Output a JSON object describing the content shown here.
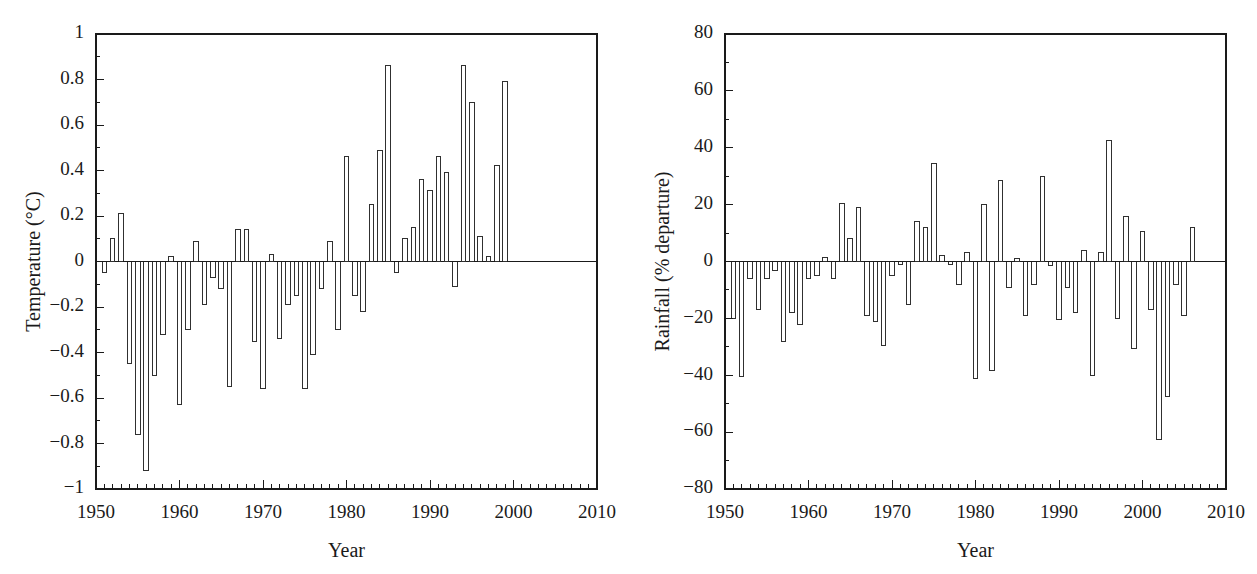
{
  "figure": {
    "background": "#ffffff",
    "ink_color": "#1a1a1a",
    "panel_count": 2
  },
  "chart_data": [
    {
      "id": "temperature-panel",
      "type": "bar",
      "title": "",
      "xlabel": "Year",
      "ylabel": "Temperature (°C)",
      "xlim": [
        1950,
        2010
      ],
      "ylim": [
        -1,
        1
      ],
      "grid": false,
      "legend": null,
      "xticks": [
        1950,
        1960,
        1970,
        1980,
        1990,
        2000,
        2010
      ],
      "xticklabels": [
        "1950",
        "1960",
        "1970",
        "1980",
        "1990",
        "2000",
        "2010"
      ],
      "xminor_tick_step": 1,
      "yticks": [
        -1,
        -0.8,
        -0.6,
        -0.4,
        -0.2,
        0,
        0.2,
        0.4,
        0.6,
        0.8,
        1
      ],
      "yticklabels": [
        "−1",
        "−0.8",
        "−0.6",
        "−0.4",
        "−0.2",
        "0",
        "0.2",
        "0.4",
        "0.6",
        "0.8",
        "1"
      ],
      "yminor_tick_step": 0.1,
      "zero_reference_line": 0,
      "x": [
        1951,
        1952,
        1953,
        1954,
        1955,
        1956,
        1957,
        1958,
        1959,
        1960,
        1961,
        1962,
        1963,
        1964,
        1965,
        1966,
        1967,
        1968,
        1969,
        1970,
        1971,
        1972,
        1973,
        1974,
        1975,
        1976,
        1977,
        1978,
        1979,
        1980,
        1981,
        1982,
        1983,
        1984,
        1985,
        1986,
        1987,
        1988,
        1989,
        1990,
        1991,
        1992,
        1993,
        1994,
        1995,
        1996,
        1997,
        1998,
        1999,
        2000,
        2001,
        2002
      ],
      "values": [
        -0.05,
        0.1,
        0.21,
        -0.45,
        -0.76,
        -0.92,
        -0.5,
        -0.32,
        0.02,
        -0.63,
        -0.3,
        0.09,
        -0.19,
        -0.07,
        -0.12,
        -0.55,
        0.14,
        0.14,
        -0.35,
        -0.56,
        0.03,
        -0.34,
        -0.19,
        -0.15,
        -0.56,
        -0.41,
        -0.12,
        0.09,
        -0.3,
        0.46,
        -0.15,
        -0.22,
        0.25,
        0.49,
        0.86,
        -0.05,
        0.1,
        0.15,
        0.36,
        0.31,
        0.46,
        0.39,
        -0.11,
        0.86,
        0.7,
        0.11,
        0.02,
        0.42,
        0.79,
        0.0,
        0.0,
        0.0
      ],
      "values_note": "bar heights read from plot; series spans 1951-2002"
    },
    {
      "id": "rainfall-panel",
      "type": "bar",
      "title": "",
      "xlabel": "Year",
      "ylabel": "Rainfall (% departure)",
      "xlim": [
        1950,
        2010
      ],
      "ylim": [
        -80,
        80
      ],
      "grid": false,
      "legend": null,
      "xticks": [
        1950,
        1960,
        1970,
        1980,
        1990,
        2000,
        2010
      ],
      "xticklabels": [
        "1950",
        "1960",
        "1970",
        "1980",
        "1990",
        "2000",
        "2010"
      ],
      "xminor_tick_step": 1,
      "yticks": [
        -80,
        -60,
        -40,
        -20,
        0,
        20,
        40,
        60,
        80
      ],
      "yticklabels": [
        "−80",
        "−60",
        "−40",
        "−20",
        "0",
        "20",
        "40",
        "60",
        "80"
      ],
      "yminor_tick_step": 10,
      "zero_reference_line": 0,
      "x": [
        1951,
        1952,
        1953,
        1954,
        1955,
        1956,
        1957,
        1958,
        1959,
        1960,
        1961,
        1962,
        1963,
        1964,
        1965,
        1966,
        1967,
        1968,
        1969,
        1970,
        1971,
        1972,
        1973,
        1974,
        1975,
        1976,
        1977,
        1978,
        1979,
        1980,
        1981,
        1982,
        1983,
        1984,
        1985,
        1986,
        1987,
        1988,
        1989,
        1990,
        1991,
        1992,
        1993,
        1994,
        1995,
        1996,
        1997,
        1998,
        1999,
        2000,
        2001,
        2002,
        2003,
        2004,
        2005,
        2006,
        2007
      ],
      "values": [
        -20,
        -40.5,
        -6,
        -17,
        -6,
        -3,
        -28,
        -18,
        -22,
        -6,
        -5,
        1.5,
        -6,
        20.5,
        8,
        19,
        -19,
        -21,
        -29.5,
        -5,
        -1,
        -15,
        14,
        12,
        34.5,
        2,
        -1,
        -8,
        3,
        -41,
        20,
        -38.5,
        28.5,
        -9,
        1,
        -19,
        -8,
        30,
        -1.5,
        -20.5,
        -9,
        -18,
        4,
        -40,
        3,
        42.5,
        -20,
        16,
        -30.5,
        10.5,
        -17,
        -62.5,
        -47.5,
        -8,
        -19,
        12,
        0
      ],
      "values_note": "bar heights read from plot; series spans 1951-2007"
    }
  ],
  "panels": {
    "left": {
      "name": "temperature-chart",
      "ylabel": "Temperature (°C)",
      "xlabel": "Year"
    },
    "right": {
      "name": "rainfall-chart",
      "ylabel": "Rainfall (% departure)",
      "xlabel": "Year"
    }
  }
}
